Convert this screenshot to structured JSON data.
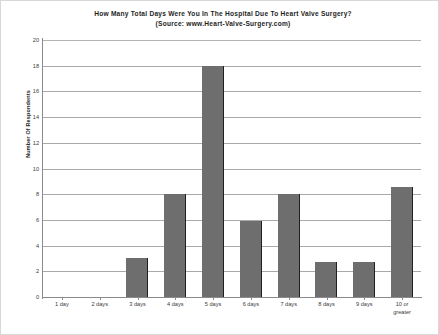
{
  "chart_data": {
    "type": "bar",
    "title": "How Many Total Days Were You In The Hospital Due To Heart Valve Surgery?",
    "subtitle": "(Source: www.Heart-Valve-Surgery.com)",
    "xlabel": "",
    "ylabel": "Number Of Respondents",
    "categories": [
      "1 day",
      "2 days",
      "3 days",
      "4 days",
      "5 days",
      "6 days",
      "7 days",
      "8 days",
      "9 days",
      "10 or greater"
    ],
    "values": [
      0,
      0,
      3,
      8,
      18,
      5.9,
      8,
      2.7,
      2.7,
      8.6
    ],
    "ylim": [
      0,
      20
    ],
    "ytick_step": 2,
    "yticks": [
      0,
      2,
      4,
      6,
      8,
      10,
      12,
      14,
      16,
      18,
      20
    ],
    "ytick_labels": [
      "0",
      "2",
      "4",
      "6",
      "8",
      "10",
      "12",
      "14",
      "16",
      "18",
      "20"
    ],
    "grid": true,
    "grid_axis": "y",
    "legend": false,
    "series_color": "#6e6e6e",
    "grid_color": "#a9a9a9",
    "axis_color": "#8a8a8a",
    "background_color": "#ffffff"
  },
  "xlabel_lines": [
    [
      "1 day"
    ],
    [
      "2 days"
    ],
    [
      "3 days"
    ],
    [
      "4 days"
    ],
    [
      "5 days"
    ],
    [
      "6 days"
    ],
    [
      "7 days"
    ],
    [
      "8 days"
    ],
    [
      "9 days"
    ],
    [
      "10 or",
      "greater"
    ]
  ]
}
